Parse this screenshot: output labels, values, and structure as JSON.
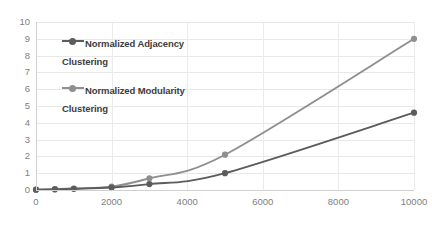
{
  "chart_data": {
    "type": "line",
    "title": "",
    "xlabel": "",
    "ylabel": "",
    "xlim": [
      0,
      10000
    ],
    "ylim": [
      0,
      10
    ],
    "grid": true,
    "legend_position": "inside-upper-left",
    "y_ticks": [
      "0",
      "1",
      "2",
      "3",
      "4",
      "5",
      "6",
      "7",
      "8",
      "9",
      "10"
    ],
    "x_ticks": [
      "0",
      "2000",
      "4000",
      "6000",
      "8000",
      "10000"
    ],
    "x": [
      0,
      500,
      1000,
      2000,
      3000,
      5000,
      10000
    ],
    "series": [
      {
        "name": "Normalized Adjacency Clustering",
        "color": "#5c5c5c",
        "marker": "circle",
        "values": [
          0.02,
          0.04,
          0.07,
          0.15,
          0.35,
          1.0,
          4.6
        ]
      },
      {
        "name": "Normalized Modularity Clustering",
        "color": "#8f8f8f",
        "marker": "circle",
        "values": [
          0.02,
          0.05,
          0.09,
          0.2,
          0.7,
          2.1,
          9.0
        ]
      }
    ]
  },
  "legend": {
    "items": [
      {
        "label": "Normalized Adjacency Clustering"
      },
      {
        "label": "Normalized Modularity Clustering"
      }
    ]
  },
  "colors": {
    "adjacency": "#5c5c5c",
    "modularity": "#8f8f8f",
    "grid": "#e8e8e8",
    "tick_text": "#808080",
    "legend_text": "#3d3d3d"
  }
}
